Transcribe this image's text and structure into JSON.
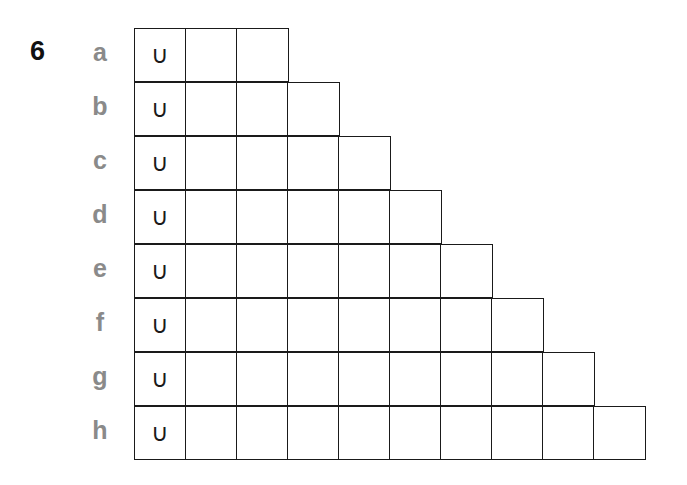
{
  "question_number": "6",
  "rows": [
    {
      "label": "a",
      "cells": 3,
      "first_symbol": "∪"
    },
    {
      "label": "b",
      "cells": 4,
      "first_symbol": "∪"
    },
    {
      "label": "c",
      "cells": 5,
      "first_symbol": "∪"
    },
    {
      "label": "d",
      "cells": 6,
      "first_symbol": "∪"
    },
    {
      "label": "e",
      "cells": 7,
      "first_symbol": "∪"
    },
    {
      "label": "f",
      "cells": 8,
      "first_symbol": "∪"
    },
    {
      "label": "g",
      "cells": 9,
      "first_symbol": "∪"
    },
    {
      "label": "h",
      "cells": 10,
      "first_symbol": "∪"
    }
  ],
  "colors": {
    "label_gray": "#8a8a8a",
    "line": "#1a1a1a"
  }
}
